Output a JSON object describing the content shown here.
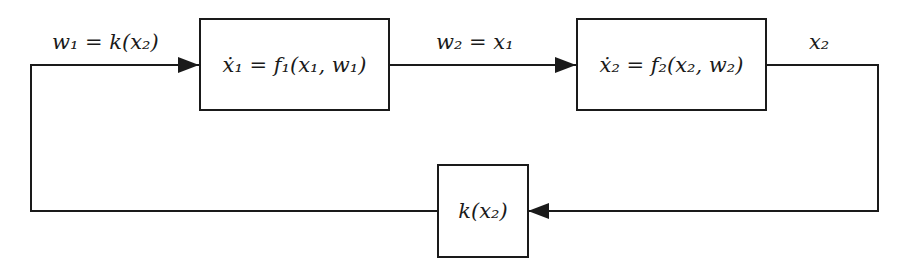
{
  "diagram": {
    "type": "block-diagram",
    "blocks": [
      {
        "id": "block-1",
        "label": "ẋ₁ = f₁(x₁, w₁)"
      },
      {
        "id": "block-2",
        "label": "ẋ₂ = f₂(x₂, w₂)"
      },
      {
        "id": "block-k",
        "label": "k(x₂)"
      }
    ],
    "signals": [
      {
        "id": "w1",
        "label": "w₁ = k(x₂)",
        "from": "block-k",
        "to": "block-1"
      },
      {
        "id": "w2",
        "label": "w₂ = x₁",
        "from": "block-1",
        "to": "block-2"
      },
      {
        "id": "x2",
        "label": "x₂",
        "from": "block-2",
        "to": "block-k"
      }
    ],
    "colors": {
      "line": "#1a1a1a",
      "background": "#ffffff"
    }
  }
}
